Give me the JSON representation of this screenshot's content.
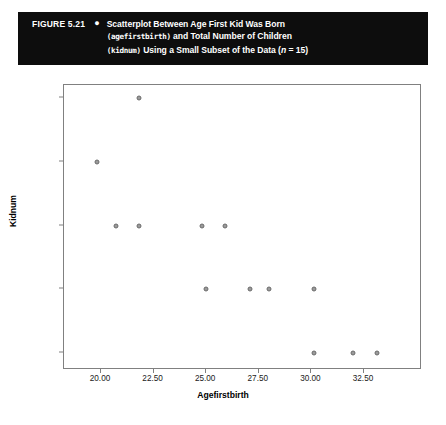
{
  "caption": {
    "figure_number": "FIGURE 5.21",
    "bullet": "●",
    "line1_a": "Scatterplot Between Age First Kid Was Born",
    "line2_mono": "(agefirstbirth)",
    "line2_b": " and Total Number of Children",
    "line3_mono": "(kidnum)",
    "line3_b": " Using a Small Subset of the Data (",
    "line3_italic": "n",
    "line3_c": " = 15)"
  },
  "chart_data": {
    "type": "scatter",
    "title": "Scatterplot Between Age First Kid Was Born (agefirstbirth) and Total Number of Children (kidnum) Using a Small Subset of the Data (n = 15)",
    "xlabel": "Agefirstbirth",
    "ylabel": "Kidnum",
    "xlim": [
      19.0,
      34.4
    ],
    "ylim": [
      0.6,
      5.6
    ],
    "grid": false,
    "legend": null,
    "n": 15,
    "xticks": [
      "20.00",
      "22.50",
      "25.00",
      "27.50",
      "30.00",
      "32.50"
    ],
    "xtick_values": [
      20.0,
      22.5,
      25.0,
      27.5,
      30.0,
      32.5
    ],
    "yticks": [
      "1.00",
      "2.00",
      "3.00",
      "4.00",
      "5.00"
    ],
    "ytick_values": [
      1,
      2,
      3,
      4,
      5
    ],
    "marker": {
      "shape": "circle",
      "fill": "#9a9a9a",
      "edge": "#6b6b6b",
      "size": 5
    },
    "points": [
      {
        "x": 21.8,
        "y": 5
      },
      {
        "x": 19.8,
        "y": 4
      },
      {
        "x": 20.7,
        "y": 3
      },
      {
        "x": 21.8,
        "y": 3
      },
      {
        "x": 24.8,
        "y": 3
      },
      {
        "x": 25.9,
        "y": 3
      },
      {
        "x": 25.0,
        "y": 2
      },
      {
        "x": 27.1,
        "y": 2
      },
      {
        "x": 28.0,
        "y": 2
      },
      {
        "x": 30.1,
        "y": 2
      },
      {
        "x": 30.1,
        "y": 1
      },
      {
        "x": 32.0,
        "y": 1
      },
      {
        "x": 33.1,
        "y": 1
      }
    ]
  }
}
